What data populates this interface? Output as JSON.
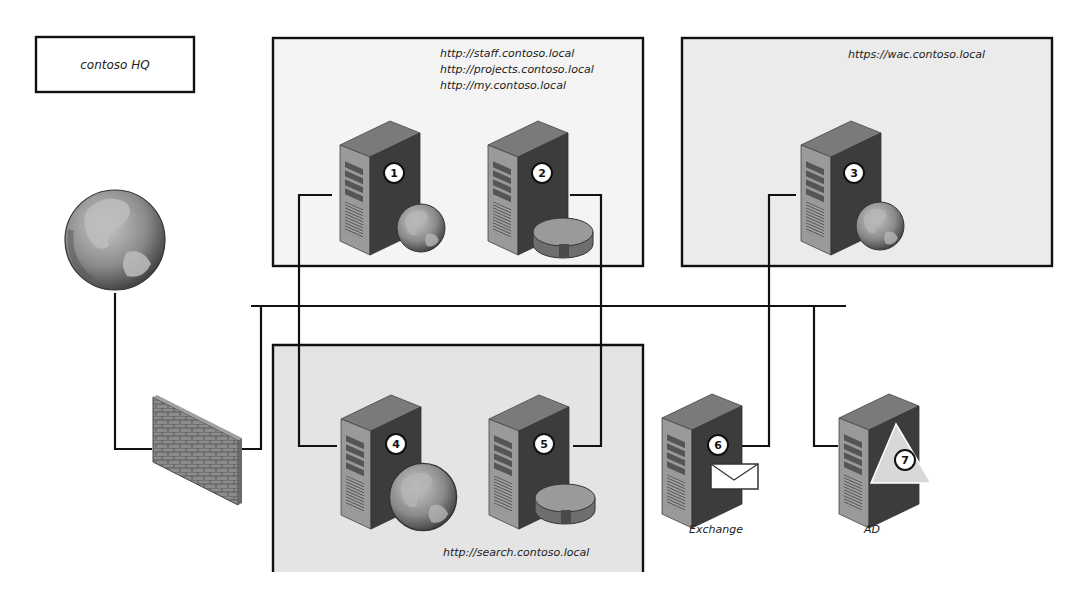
{
  "diagram": {
    "title": "contoso HQ",
    "zones": [
      {
        "id": "web-zone",
        "urls": [
          "http://staff.contoso.local",
          "http://projects.contoso.local",
          "http://my.contoso.local"
        ]
      },
      {
        "id": "wac-zone",
        "urls": [
          "https://wac.contoso.local"
        ]
      },
      {
        "id": "search-zone",
        "urls": [
          "http://search.contoso.local"
        ]
      }
    ],
    "nodes": [
      {
        "number": "1",
        "role": "web-server",
        "zone": "web-zone"
      },
      {
        "number": "2",
        "role": "database-server",
        "zone": "web-zone"
      },
      {
        "number": "3",
        "role": "web-server",
        "zone": "wac-zone"
      },
      {
        "number": "4",
        "role": "web-server",
        "zone": "search-zone"
      },
      {
        "number": "5",
        "role": "database-server",
        "zone": "search-zone"
      },
      {
        "number": "6",
        "role": "mail-server",
        "label": "Exchange"
      },
      {
        "number": "7",
        "role": "directory-server",
        "label": "AD"
      }
    ],
    "external": [
      {
        "role": "internet-globe"
      },
      {
        "role": "firewall"
      }
    ],
    "colors": {
      "line": "#111111",
      "zone_fill_light": "#f4f4f4",
      "zone_fill_shaded": "#e6e6e6",
      "server_front": "#9a9a9a",
      "server_side": "#3c3c3c",
      "server_top": "#7a7a7a"
    }
  }
}
